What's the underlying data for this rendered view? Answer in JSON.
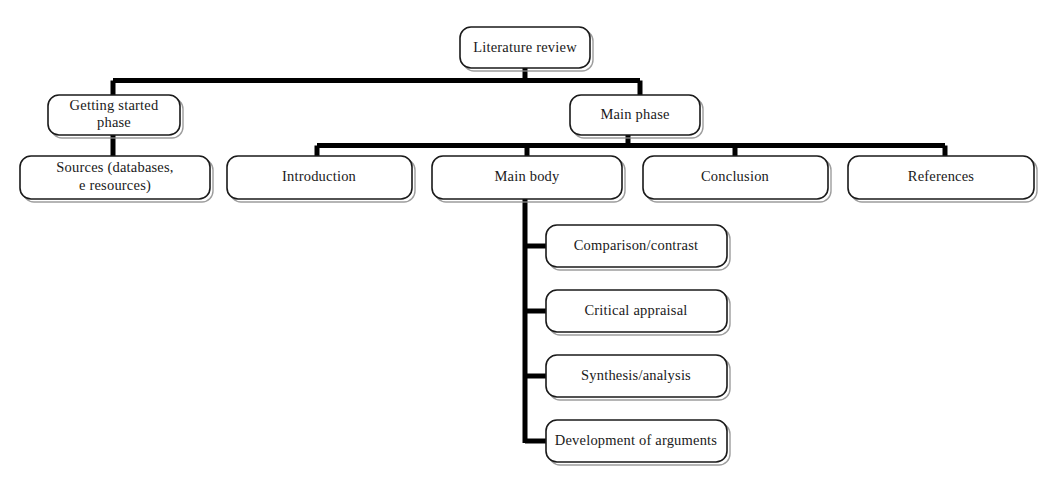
{
  "diagram": {
    "type": "hierarchy-flowchart",
    "colors": {
      "box_fill": "#ffffff",
      "box_stroke": "#1a1a1a",
      "connector": "#000000",
      "text": "#1a1a1a",
      "background": "#ffffff"
    },
    "nodes": {
      "root": {
        "label": "Literature review"
      },
      "getting_started": {
        "label_line1": "Getting started",
        "label_line2": "phase"
      },
      "sources": {
        "label_line1": "Sources (databases,",
        "label_line2": "e resources)"
      },
      "main_phase": {
        "label": "Main phase"
      },
      "introduction": {
        "label": "Introduction"
      },
      "main_body": {
        "label": "Main body"
      },
      "conclusion": {
        "label": "Conclusion"
      },
      "references": {
        "label": "References"
      },
      "comparison_contrast": {
        "label": "Comparison/contrast"
      },
      "critical_appraisal": {
        "label": "Critical appraisal"
      },
      "synthesis_analysis": {
        "label": "Synthesis/analysis"
      },
      "development_arguments": {
        "label": "Development of arguments"
      }
    }
  }
}
